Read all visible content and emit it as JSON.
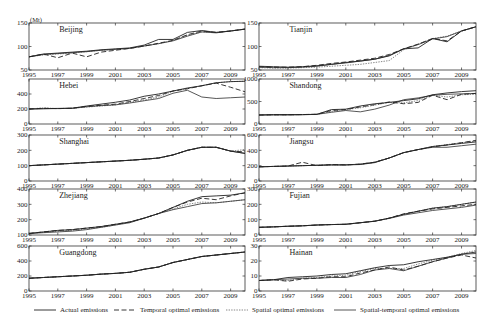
{
  "chart_data": {
    "type": "line",
    "unit": "(Mt)",
    "x": [
      1995,
      1996,
      1997,
      1998,
      1999,
      2000,
      2001,
      2002,
      2003,
      2004,
      2005,
      2006,
      2007,
      2008,
      2009,
      2010
    ],
    "xticks": [
      1995,
      1997,
      1999,
      2001,
      2003,
      2005,
      2007,
      2009
    ],
    "legend": [
      {
        "key": "actual",
        "label": "Actual emissions",
        "style": "solid"
      },
      {
        "key": "temporal",
        "label": "Temporal optimal emissions",
        "style": "dashed"
      },
      {
        "key": "spatial",
        "label": "Spatial optimal emissions",
        "style": "dotted"
      },
      {
        "key": "st",
        "label": "Spatial-temporal optimal emissions",
        "style": "solid-thin"
      }
    ],
    "legend_position": "bottom",
    "grid": false,
    "panels": [
      {
        "name": "Beijing",
        "col": 0,
        "row": 0,
        "ylim": [
          50,
          150
        ],
        "yticks": [
          50,
          100,
          150
        ],
        "show_unit": true,
        "series": {
          "actual": [
            78,
            84,
            86,
            88,
            90,
            93,
            95,
            97,
            103,
            115,
            115,
            130,
            134,
            130,
            133,
            137
          ],
          "temporal": [
            78,
            84,
            76,
            86,
            78,
            88,
            92,
            96,
            101,
            107,
            113,
            125,
            133,
            130,
            133,
            137
          ],
          "spatial": [
            78,
            82,
            84,
            86,
            89,
            92,
            94,
            96,
            101,
            106,
            113,
            124,
            131,
            130,
            133,
            137
          ],
          "st": [
            78,
            83,
            85,
            87,
            89,
            92,
            94,
            96,
            101,
            106,
            112,
            122,
            131,
            129,
            133,
            137
          ]
        }
      },
      {
        "name": "Tianjin",
        "col": 1,
        "row": 0,
        "ylim": [
          50,
          150
        ],
        "yticks": [
          50,
          100,
          150
        ],
        "show_unit": false,
        "series": {
          "actual": [
            58,
            57,
            56,
            57,
            59,
            62,
            66,
            69,
            73,
            80,
            95,
            97,
            117,
            110,
            133,
            142
          ],
          "temporal": [
            57,
            56,
            56,
            57,
            60,
            64,
            67,
            71,
            75,
            83,
            95,
            105,
            117,
            112,
            133,
            142
          ],
          "spatial": [
            55,
            54,
            54,
            55,
            56,
            58,
            60,
            62,
            66,
            70,
            93,
            105,
            117,
            122,
            133,
            142
          ],
          "st": [
            56,
            55,
            55,
            56,
            58,
            62,
            65,
            69,
            73,
            81,
            95,
            104,
            116,
            121,
            133,
            142
          ]
        }
      },
      {
        "name": "Hebei",
        "col": 0,
        "row": 1,
        "ylim": [
          0,
          600
        ],
        "yticks": [
          0,
          200,
          400
        ],
        "show_unit": false,
        "series": {
          "actual": [
            200,
            205,
            208,
            210,
            240,
            265,
            290,
            320,
            370,
            400,
            440,
            480,
            510,
            550,
            565,
            570
          ],
          "temporal": [
            200,
            210,
            205,
            210,
            235,
            250,
            265,
            300,
            340,
            380,
            440,
            470,
            510,
            545,
            490,
            430
          ],
          "spatial": [
            200,
            215,
            205,
            210,
            225,
            240,
            255,
            290,
            320,
            360,
            440,
            470,
            510,
            550,
            565,
            570
          ],
          "st": [
            200,
            203,
            206,
            210,
            230,
            245,
            255,
            280,
            310,
            340,
            410,
            450,
            360,
            340,
            350,
            360
          ]
        }
      },
      {
        "name": "Shandong",
        "col": 1,
        "row": 1,
        "ylim": [
          0,
          1000
        ],
        "yticks": [
          0,
          500,
          1000
        ],
        "show_unit": false,
        "series": {
          "actual": [
            200,
            210,
            210,
            210,
            215,
            320,
            330,
            400,
            450,
            480,
            520,
            560,
            650,
            690,
            720,
            740
          ],
          "temporal": [
            200,
            205,
            205,
            210,
            215,
            300,
            320,
            380,
            430,
            490,
            450,
            480,
            640,
            540,
            660,
            680
          ],
          "spatial": [
            200,
            205,
            205,
            210,
            215,
            280,
            320,
            360,
            420,
            480,
            470,
            520,
            640,
            600,
            650,
            660
          ],
          "st": [
            200,
            200,
            200,
            205,
            215,
            260,
            300,
            270,
            330,
            420,
            540,
            580,
            640,
            660,
            670,
            680
          ]
        }
      },
      {
        "name": "Shanghai",
        "col": 0,
        "row": 2,
        "ylim": [
          0,
          300
        ],
        "yticks": [
          0,
          100,
          200,
          300
        ],
        "show_unit": false,
        "series": {
          "actual": [
            100,
            105,
            110,
            115,
            120,
            125,
            130,
            135,
            142,
            150,
            170,
            200,
            220,
            220,
            195,
            180
          ],
          "temporal": [
            100,
            105,
            110,
            115,
            120,
            125,
            130,
            135,
            142,
            150,
            170,
            200,
            220,
            220,
            195,
            190
          ],
          "spatial": [
            100,
            105,
            110,
            115,
            120,
            125,
            130,
            135,
            142,
            150,
            170,
            200,
            220,
            220,
            195,
            205
          ],
          "st": [
            100,
            105,
            110,
            115,
            120,
            125,
            130,
            135,
            142,
            150,
            170,
            200,
            220,
            220,
            195,
            180
          ]
        }
      },
      {
        "name": "Jiangsu",
        "col": 1,
        "row": 2,
        "ylim": [
          0,
          600
        ],
        "yticks": [
          0,
          200,
          400,
          600
        ],
        "show_unit": false,
        "series": {
          "actual": [
            185,
            190,
            195,
            200,
            205,
            210,
            210,
            215,
            240,
            300,
            370,
            410,
            450,
            470,
            490,
            510
          ],
          "temporal": [
            185,
            190,
            195,
            245,
            200,
            215,
            210,
            220,
            245,
            300,
            370,
            410,
            445,
            470,
            500,
            530
          ],
          "spatial": [
            185,
            190,
            195,
            200,
            205,
            210,
            210,
            220,
            245,
            300,
            370,
            410,
            450,
            475,
            500,
            520
          ],
          "st": [
            185,
            190,
            195,
            200,
            205,
            210,
            210,
            220,
            245,
            300,
            370,
            410,
            440,
            440,
            460,
            480
          ]
        }
      },
      {
        "name": "Zhejiang",
        "col": 0,
        "row": 3,
        "ylim": [
          100,
          400
        ],
        "yticks": [
          100,
          200,
          300,
          400
        ],
        "show_unit": false,
        "series": {
          "actual": [
            110,
            120,
            130,
            135,
            145,
            155,
            170,
            185,
            210,
            240,
            280,
            320,
            350,
            355,
            360,
            375
          ],
          "temporal": [
            110,
            120,
            130,
            135,
            145,
            155,
            170,
            185,
            210,
            240,
            280,
            315,
            340,
            330,
            355,
            375
          ],
          "spatial": [
            110,
            118,
            125,
            130,
            140,
            150,
            165,
            185,
            210,
            240,
            270,
            300,
            315,
            310,
            320,
            330
          ],
          "st": [
            110,
            115,
            120,
            125,
            135,
            150,
            165,
            180,
            210,
            240,
            265,
            285,
            305,
            310,
            320,
            330
          ]
        }
      },
      {
        "name": "Fujian",
        "col": 1,
        "row": 3,
        "ylim": [
          0,
          300
        ],
        "yticks": [
          0,
          100,
          200,
          300
        ],
        "show_unit": false,
        "series": {
          "actual": [
            50,
            53,
            57,
            60,
            65,
            68,
            70,
            80,
            90,
            110,
            135,
            155,
            175,
            185,
            200,
            215
          ],
          "temporal": [
            50,
            53,
            57,
            60,
            65,
            68,
            70,
            80,
            90,
            110,
            138,
            155,
            170,
            180,
            190,
            200
          ],
          "spatial": [
            50,
            53,
            57,
            60,
            65,
            68,
            70,
            80,
            90,
            110,
            135,
            155,
            175,
            185,
            200,
            215
          ],
          "st": [
            50,
            53,
            57,
            60,
            65,
            68,
            70,
            80,
            90,
            108,
            130,
            145,
            160,
            170,
            180,
            195
          ]
        }
      },
      {
        "name": "Guangdong",
        "col": 0,
        "row": 4,
        "ylim": [
          0,
          600
        ],
        "yticks": [
          0,
          200,
          400,
          600
        ],
        "show_unit": false,
        "series": {
          "actual": [
            170,
            180,
            190,
            200,
            210,
            225,
            235,
            250,
            290,
            320,
            380,
            420,
            460,
            480,
            500,
            520
          ],
          "temporal": [
            170,
            180,
            190,
            200,
            210,
            225,
            235,
            250,
            290,
            320,
            380,
            420,
            460,
            480,
            500,
            520
          ],
          "spatial": [
            170,
            180,
            190,
            200,
            210,
            225,
            235,
            250,
            290,
            320,
            380,
            420,
            460,
            480,
            500,
            520
          ],
          "st": [
            170,
            180,
            190,
            200,
            210,
            225,
            235,
            250,
            290,
            320,
            380,
            420,
            460,
            480,
            500,
            520
          ]
        }
      },
      {
        "name": "Hainan",
        "col": 1,
        "row": 4,
        "ylim": [
          0,
          30
        ],
        "yticks": [
          0,
          10,
          20,
          30
        ],
        "show_unit": false,
        "series": {
          "actual": [
            7,
            7.5,
            9,
            9.5,
            10,
            11,
            11.5,
            13.5,
            15.5,
            17,
            17.5,
            19.5,
            21,
            22.5,
            24.5,
            26
          ],
          "temporal": [
            7,
            7.5,
            6.5,
            8,
            8.5,
            9.5,
            9.5,
            12,
            14,
            16,
            14,
            16.5,
            19.5,
            22,
            24,
            22
          ],
          "spatial": [
            7,
            7.5,
            7,
            8.5,
            9,
            10,
            10.5,
            13,
            15,
            15,
            15,
            18,
            20.5,
            22.5,
            25,
            27
          ],
          "st": [
            7,
            7.5,
            8,
            8.5,
            8.5,
            9,
            9,
            11,
            14,
            15,
            13.5,
            16.5,
            19.5,
            22,
            24.5,
            25
          ]
        }
      }
    ]
  },
  "layout": {
    "cols_x": [
      [
        29,
        245
      ],
      [
        259,
        476
      ]
    ],
    "rows_y": [
      [
        23,
        70
      ],
      [
        79,
        124
      ],
      [
        135,
        181
      ],
      [
        189,
        235
      ],
      [
        246,
        291
      ]
    ]
  }
}
